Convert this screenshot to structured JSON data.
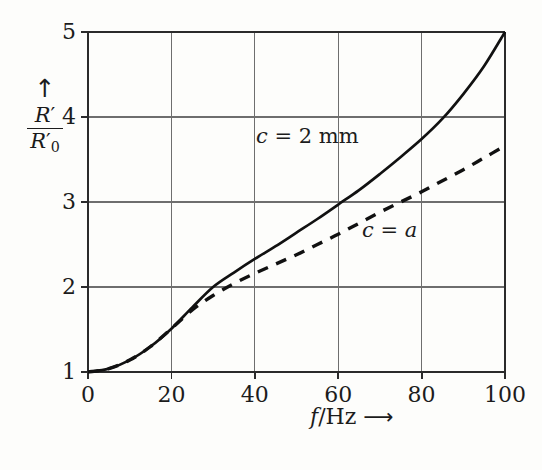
{
  "chart_data": {
    "type": "line",
    "title": "",
    "xlabel": "f/Hz",
    "ylabel": "R'/R'0",
    "xlim": [
      0,
      100
    ],
    "ylim": [
      1,
      5
    ],
    "x_ticks": [
      "0",
      "20",
      "40",
      "60",
      "80",
      "100"
    ],
    "x_tick_values": [
      0,
      20,
      40,
      60,
      80,
      100
    ],
    "y_ticks": [
      "1",
      "2",
      "3",
      "4",
      "5"
    ],
    "y_tick_values": [
      1,
      2,
      3,
      4,
      5
    ],
    "grid": true,
    "legend_position": "inline-annotations",
    "series": [
      {
        "name": "c = 2 mm",
        "style": "solid",
        "color": "#111111",
        "x": [
          0,
          5,
          10,
          15,
          20,
          25,
          30,
          35,
          40,
          45,
          50,
          55,
          60,
          65,
          70,
          75,
          80,
          85,
          90,
          95,
          100
        ],
        "values": [
          1.0,
          1.04,
          1.14,
          1.3,
          1.51,
          1.76,
          2.0,
          2.17,
          2.33,
          2.48,
          2.64,
          2.8,
          2.97,
          3.14,
          3.33,
          3.53,
          3.74,
          3.98,
          4.27,
          4.6,
          5.0
        ]
      },
      {
        "name": "c = a",
        "style": "dashed",
        "color": "#111111",
        "x": [
          0,
          5,
          10,
          15,
          20,
          25,
          30,
          35,
          40,
          45,
          50,
          55,
          60,
          65,
          70,
          75,
          80,
          85,
          90,
          95,
          100
        ],
        "values": [
          1.0,
          1.04,
          1.14,
          1.3,
          1.51,
          1.73,
          1.9,
          2.04,
          2.16,
          2.27,
          2.38,
          2.5,
          2.62,
          2.75,
          2.88,
          3.0,
          3.12,
          3.25,
          3.38,
          3.52,
          3.66
        ]
      }
    ],
    "annotations": [
      {
        "text": "c = 2 mm",
        "x": 44,
        "y": 4.1
      },
      {
        "text": "c = a",
        "x": 69,
        "y": 2.68
      }
    ]
  },
  "axes": {
    "y_title": {
      "arrow": "↑",
      "numerator": "R",
      "numerator_prime": "′",
      "denominator": "R",
      "denominator_prime": "′",
      "denominator_sub": "0"
    },
    "x_title": {
      "variable": "f",
      "slash": "/",
      "unit": "Hz",
      "arrow": "⟶"
    }
  },
  "labels": {
    "solid_curve": {
      "variable": "c",
      "equals": "=",
      "value": "2 mm"
    },
    "dashed_curve": {
      "variable": "c",
      "equals": "=",
      "value": "a"
    }
  },
  "colors": {
    "background": "#fdfdfb",
    "axis": "#2b2b2b",
    "grid": "#6e6e6e",
    "curve": "#111111"
  }
}
